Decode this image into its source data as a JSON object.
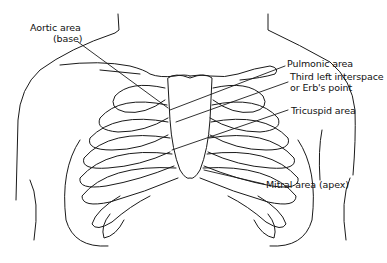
{
  "diagram": {
    "line_color": "#1a1a1a",
    "background": "#ffffff",
    "labels": [
      {
        "id": "aortic",
        "line1": "Aortic area",
        "line2": "(base)"
      },
      {
        "id": "pulmonic",
        "line1": "Pulmonic area"
      },
      {
        "id": "erb",
        "line1": "Third left interspace",
        "line2": "or Erb's point"
      },
      {
        "id": "tricuspid",
        "line1": "Tricuspid area"
      },
      {
        "id": "mitral",
        "line1": "Mitral area (apex)"
      }
    ]
  }
}
